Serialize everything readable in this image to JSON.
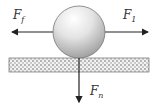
{
  "diagram": {
    "title": "",
    "forces": [
      {
        "id": "friction",
        "symbol": "F",
        "subscript": "f",
        "direction": "left"
      },
      {
        "id": "applied",
        "symbol": "F",
        "subscript": "1",
        "direction": "right"
      },
      {
        "id": "normal",
        "symbol": "F",
        "subscript": "n",
        "direction": "down"
      }
    ],
    "objects": [
      "ball",
      "ground-surface"
    ]
  }
}
